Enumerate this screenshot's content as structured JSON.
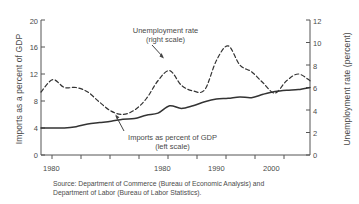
{
  "chart_data": {
    "type": "line",
    "title": "",
    "xlabel": "",
    "ylabel": "Imports as a percent of GDP",
    "y2label": "Unemployment rate (percent)",
    "xlim": [
      1980,
      2003
    ],
    "ylim": [
      0,
      20
    ],
    "y2lim": [
      0,
      12
    ],
    "grid": false,
    "legend_position": "inline-annotations",
    "x_ticks": [
      1980,
      1985,
      1990,
      1995,
      2000
    ],
    "x_tick_labels": [
      "1980",
      "1980",
      "1990",
      "2000"
    ],
    "x_tick_label_positions": [
      1980,
      1985,
      1990,
      2000
    ],
    "y_ticks": [
      0,
      4,
      8,
      12,
      16,
      20
    ],
    "y_tick_labels": [
      "0",
      "4",
      "8",
      "12",
      "16",
      "20"
    ],
    "y2_ticks": [
      0,
      2,
      4,
      6,
      8,
      10,
      12
    ],
    "y2_tick_labels": [
      "0",
      "2",
      "4",
      "6",
      "8",
      "10",
      "12"
    ],
    "x": [
      1980,
      1981,
      1982,
      1983,
      1984,
      1985,
      1986,
      1987,
      1988,
      1989,
      1990,
      1991,
      1992,
      1993,
      1994,
      1995,
      1996,
      1997,
      1998,
      1999,
      2000,
      2001,
      2002,
      2003
    ],
    "series": [
      {
        "name": "Imports as percent of GDP",
        "axis": "left",
        "style": "solid",
        "color": "#333333",
        "units": "percent of GDP",
        "values": [
          4.0,
          4.0,
          4.0,
          4.2,
          4.6,
          4.8,
          5.0,
          5.3,
          5.4,
          5.9,
          6.2,
          7.3,
          6.9,
          7.3,
          7.9,
          8.3,
          8.4,
          8.6,
          8.5,
          9.0,
          9.4,
          9.6,
          9.7,
          10.0
        ]
      },
      {
        "name": "Unemployment rate",
        "axis": "right",
        "style": "dashed",
        "color": "#333333",
        "units": "percent",
        "values": [
          5.6,
          6.7,
          6.0,
          6.0,
          5.6,
          4.7,
          3.9,
          3.6,
          4.0,
          5.0,
          6.6,
          7.5,
          6.2,
          5.7,
          5.8,
          8.4,
          9.7,
          8.0,
          7.4,
          6.4,
          5.5,
          6.6,
          7.2,
          6.6
        ]
      }
    ],
    "annotations": [
      {
        "name": "unemployment-annotation",
        "line1": "Unemployment rate",
        "line2": "(right scale)",
        "has_arrow": true
      },
      {
        "name": "imports-annotation",
        "line1": "Imports as percent of GDP",
        "line2": "(left scale)",
        "has_arrow": true
      }
    ],
    "source": {
      "line1": "Source: Department of Commerce (Bureau of Economic Analysis) and",
      "line2": "Department of Labor (Bureau of Labor Statistics)."
    }
  }
}
